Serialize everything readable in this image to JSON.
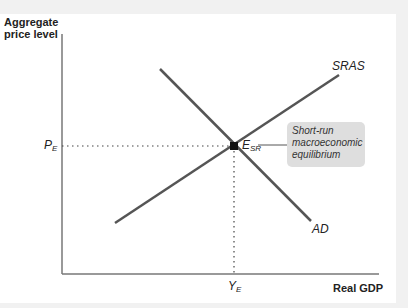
{
  "axes": {
    "y_label": "Aggregate price level",
    "x_label": "Real GDP"
  },
  "curves": {
    "sras_label": "SRAS",
    "ad_label": "AD"
  },
  "equilibrium": {
    "price_label": "P",
    "price_sub": "E",
    "output_label": "Y",
    "output_sub": "E",
    "point_label": "E",
    "point_sub": "SR",
    "callout": "Short-run macroeconomic equilibrium"
  },
  "colors": {
    "curve": "#555555",
    "axis": "#777777",
    "callout_bg": "#dedede",
    "point": "#111111"
  }
}
